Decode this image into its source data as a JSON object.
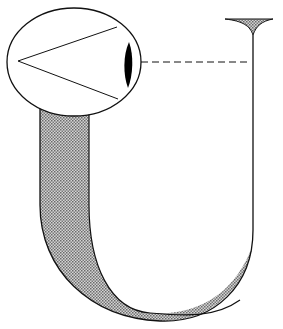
{
  "diagram": {
    "title": "",
    "elements": [
      {
        "id": "eyeball",
        "type": "ellipse",
        "label": ""
      },
      {
        "id": "visual-cone",
        "type": "lines",
        "label": ""
      },
      {
        "id": "lens",
        "type": "black-crescent",
        "label": ""
      },
      {
        "id": "line-of-sight",
        "type": "dashed-line",
        "label": ""
      },
      {
        "id": "funnel-opening",
        "type": "shaded-funnel",
        "label": ""
      },
      {
        "id": "u-tube",
        "type": "shaded-band-curve",
        "label": ""
      }
    ],
    "colors": {
      "stroke": "#111111",
      "fill_shade": "#9a9a9a",
      "lens": "#000000",
      "background": "#ffffff"
    }
  }
}
